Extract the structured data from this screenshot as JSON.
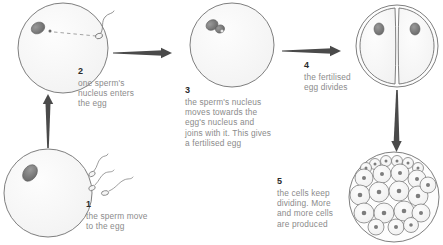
{
  "diagram": {
    "background_color": "#ffffff",
    "text_color": "#8b8b8b",
    "number_color": "#2b2b2b",
    "outline_color": "#6f6f6f",
    "nucleus_color": "#7a7a7a"
  },
  "steps": [
    {
      "number": "1",
      "text": "the sperm move\nto the egg",
      "illustration": "egg-with-sperm"
    },
    {
      "number": "2",
      "text": "one sperm's\nnucleus enters\nthe egg",
      "illustration": "egg-sperm-entering"
    },
    {
      "number": "3",
      "text": "the sperm's nucleus\nmoves towards the\negg's nucleus and\njoins with it. This gives\na fertilised egg",
      "illustration": "egg-nuclei-joining"
    },
    {
      "number": "4",
      "text": "the fertilised\negg divides",
      "illustration": "two-cell-embryo"
    },
    {
      "number": "5",
      "text": "the cells keep\ndividing. More\nand more cells\nare produced",
      "illustration": "morula-many-cells"
    }
  ],
  "arrows": [
    {
      "name": "arrow-step1-to-step2",
      "direction": "up"
    },
    {
      "name": "arrow-step2-to-step3",
      "direction": "right"
    },
    {
      "name": "arrow-step3-to-step4",
      "direction": "right"
    },
    {
      "name": "arrow-step4-to-step5",
      "direction": "down"
    }
  ]
}
